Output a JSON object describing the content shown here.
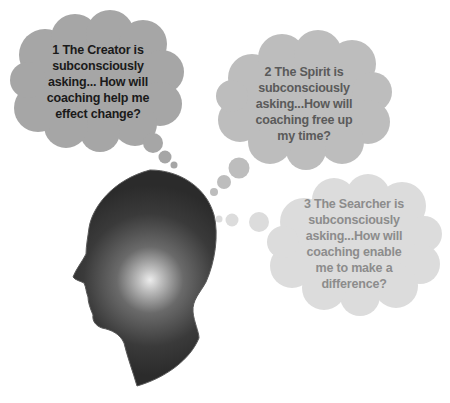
{
  "diagram": {
    "colors": {
      "head_dark": "#2e2e2e",
      "head_glow": "#e8e8e8",
      "cloud1_fill": "#a6a6a6",
      "cloud1_text": "#1a1a1a",
      "cloud2_fill": "#bdbdbd",
      "cloud2_text": "#5a5a5a",
      "cloud3_fill": "#dcdcdc",
      "cloud3_text": "#8c8c8c"
    },
    "clouds": [
      {
        "id": 1,
        "lines": [
          "1 The Creator is",
          "subconsciously",
          "asking... How will",
          "coaching help me",
          "effect change?"
        ]
      },
      {
        "id": 2,
        "lines": [
          "2 The Spirit is",
          "subconsciously",
          "asking...How will",
          "coaching free up",
          "my time?"
        ]
      },
      {
        "id": 3,
        "lines": [
          "3 The Searcher is",
          "subconsciously",
          "asking...How will",
          "coaching enable",
          "me to make a",
          "difference?"
        ]
      }
    ]
  }
}
